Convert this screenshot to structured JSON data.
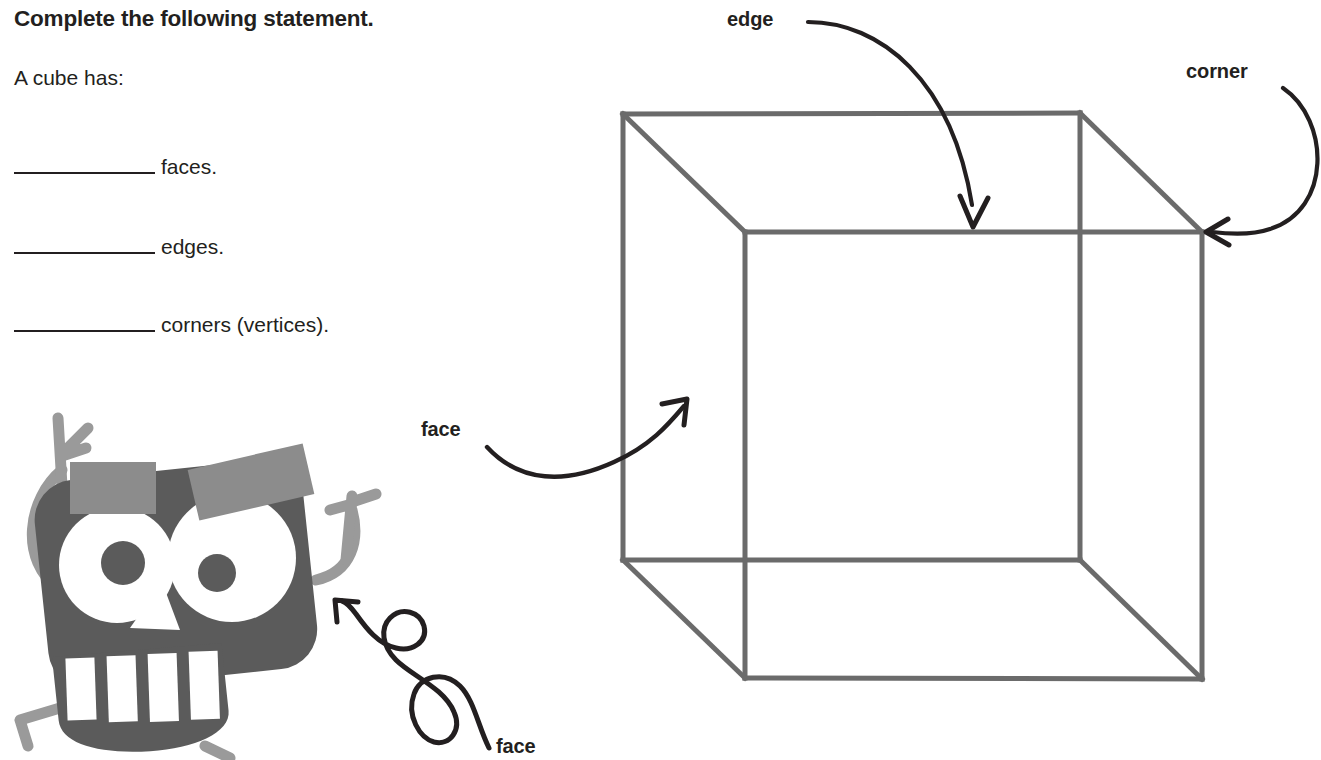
{
  "worksheet": {
    "title": "Complete the following statement.",
    "subtitle": "A cube has:",
    "blanks": [
      {
        "id": "faces",
        "label": "faces.",
        "value": ""
      },
      {
        "id": "edges",
        "label": "edges.",
        "value": ""
      },
      {
        "id": "corners",
        "label": "corners (vertices).",
        "value": ""
      }
    ]
  },
  "diagram": {
    "shape": "cube",
    "callouts": [
      {
        "id": "edge",
        "text": "edge",
        "points_to": "top-front-edge"
      },
      {
        "id": "corner",
        "text": "corner",
        "points_to": "front-top-right-vertex"
      },
      {
        "id": "face-1",
        "text": "face",
        "points_to": "front-face"
      },
      {
        "id": "face-2",
        "text": "face",
        "points_to": "robot-face"
      }
    ]
  },
  "colors": {
    "cube_stroke": "#6b6b6b",
    "arrow_stroke": "#231f20",
    "text": "#231f20",
    "robot_body": "#5b5b5b",
    "robot_limbs": "#9a9a9a",
    "robot_brow": "#8c8c8c",
    "page_background": "#ffffff"
  },
  "robot": {
    "name": "cartoon-robot-mascot",
    "parts": [
      "head",
      "left-eye",
      "right-eye",
      "left-brow",
      "right-brow",
      "nose",
      "mouth",
      "teeth",
      "left-arm",
      "right-arm",
      "left-leg",
      "right-leg"
    ]
  }
}
